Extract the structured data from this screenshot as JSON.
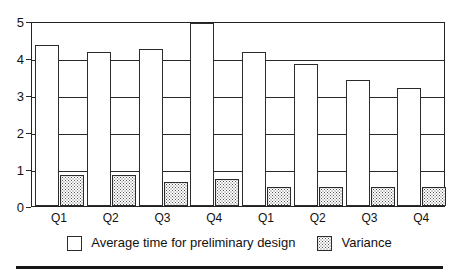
{
  "chart_data": {
    "type": "bar",
    "title": "",
    "subtitle": "",
    "xlabel": "",
    "ylabel": "",
    "ylim": [
      0,
      5
    ],
    "yticks": [
      0,
      1,
      2,
      3,
      4,
      5
    ],
    "ytick_labels": [
      "0",
      "1",
      "2",
      "3",
      "4",
      "5"
    ],
    "grid": true,
    "grid_axis": "y",
    "legend_position": "bottom-center",
    "categories": [
      "Q1",
      "Q2",
      "Q3",
      "Q4",
      "Q1",
      "Q2",
      "Q3",
      "Q4"
    ],
    "series": [
      {
        "name": "Average time for preliminary design",
        "fill": "white",
        "values": [
          4.35,
          4.15,
          4.25,
          4.95,
          4.15,
          3.85,
          3.4,
          3.2
        ]
      },
      {
        "name": "Variance",
        "fill": "dotted-pattern",
        "values": [
          0.85,
          0.85,
          0.65,
          0.72,
          0.52,
          0.52,
          0.52,
          0.52
        ]
      }
    ]
  },
  "legend": {
    "items": [
      {
        "label": "Average time for preliminary design",
        "swatch": "white-square"
      },
      {
        "label": "Variance",
        "swatch": "dotted-square"
      }
    ]
  },
  "colors": {
    "axis": "#2a2a2a",
    "bar_fill": "#ffffff",
    "bar_stroke": "#2b2b2b",
    "pattern_dot": "#555555",
    "rule": "#151515",
    "background": "#ffffff",
    "text": "#111111"
  }
}
